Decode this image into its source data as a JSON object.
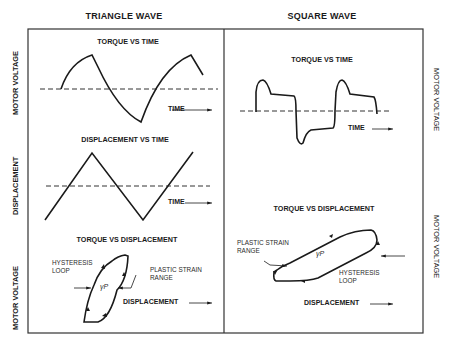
{
  "columns": {
    "left": {
      "title": "TRIANGLE WAVE"
    },
    "right": {
      "title": "SQUARE WAVE"
    }
  },
  "side_labels": {
    "left": [
      "MOTOR VOLTAGE",
      "DISPLACEMENT",
      "MOTOR VOLTAGE"
    ],
    "right": [
      "MOTOR VOLTAGE",
      "MOTOR VOLTAGE"
    ]
  },
  "plots": {
    "triangle_torque": {
      "title": "TORQUE VS TIME",
      "xlabel": "TIME"
    },
    "triangle_displacement": {
      "title": "DISPLACEMENT VS TIME",
      "xlabel": "TIME"
    },
    "triangle_loop": {
      "title": "TORQUE VS DISPLACEMENT",
      "xlabel": "DISPLACEMENT",
      "annotation_loop": "HYSTERESIS\nLOOP",
      "annotation_range": "PLASTIC STRAIN\nRANGE",
      "symbol": "γP"
    },
    "square_torque": {
      "title": "TORQUE VS TIME",
      "xlabel": "TIME"
    },
    "square_loop": {
      "title": "TORQUE VS DISPLACEMENT",
      "xlabel": "DISPLACEMENT",
      "annotation_range": "PLASTIC STRAIN\nRANGE",
      "annotation_loop": "HYSTERESIS\nLOOP",
      "symbol": "γP"
    }
  },
  "colors": {
    "line": "#1a1a1a",
    "frame": "#333333",
    "background": "#ffffff"
  }
}
